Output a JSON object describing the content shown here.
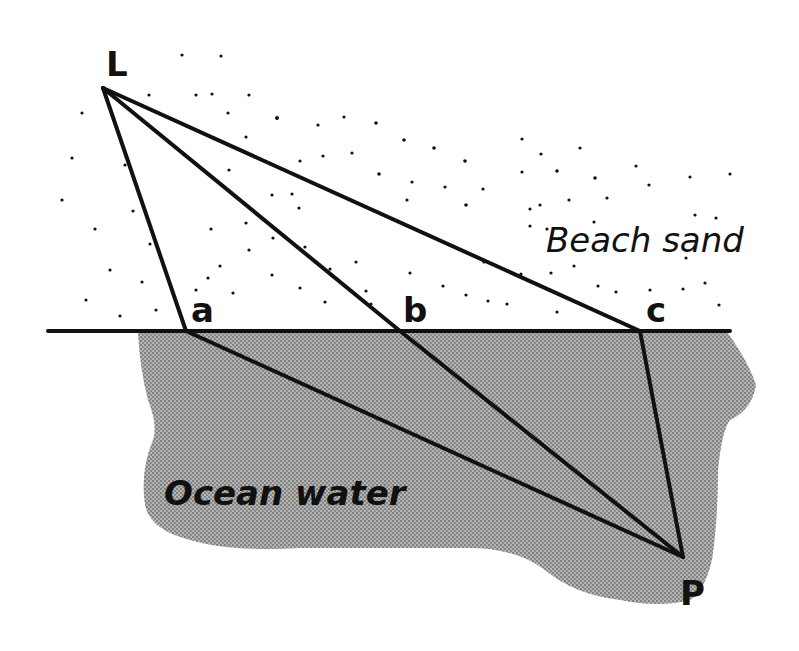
{
  "diagram": {
    "type": "refraction-path-diagram",
    "colors": {
      "ink": "#111111",
      "water_fill": "#a9a9a9",
      "water_dot": "#6e6e6e",
      "background": "#ffffff"
    },
    "regions": {
      "beach": {
        "label": "Beach sand"
      },
      "ocean": {
        "label": "Ocean water"
      }
    },
    "points": {
      "L": {
        "label": "L",
        "x": 103,
        "y": 88
      },
      "a": {
        "label": "a",
        "x": 186,
        "y": 331
      },
      "b": {
        "label": "b",
        "x": 400,
        "y": 331
      },
      "c": {
        "label": "c",
        "x": 640,
        "y": 331
      },
      "P": {
        "label": "P",
        "x": 683,
        "y": 557
      }
    },
    "paths": [
      {
        "name": "path-a",
        "from": "L",
        "via": "a",
        "to": "P"
      },
      {
        "name": "path-b",
        "from": "L",
        "via": "b",
        "to": "P"
      },
      {
        "name": "path-c",
        "from": "L",
        "via": "c",
        "to": "P"
      }
    ],
    "shoreline": {
      "x1": 48,
      "x2": 730,
      "y": 331
    }
  }
}
